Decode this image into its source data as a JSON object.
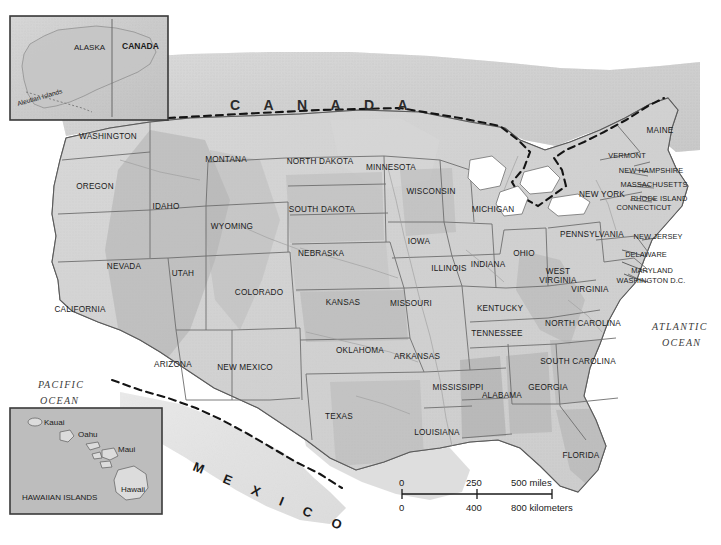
{
  "map": {
    "title": "Map of the United States",
    "country_label": "C A N A D A",
    "mexico_label": "M E X I C O",
    "oceans": [
      {
        "name": "pacific-ocean-label",
        "line1": "PACIFIC",
        "line2": "OCEAN"
      },
      {
        "name": "atlantic-ocean-label",
        "line1": "ATLANTIC",
        "line2": "OCEAN"
      }
    ],
    "colors": {
      "land_light": "#e9e9e9",
      "land_mid": "#c9c9c9",
      "land_dark": "#b0b0b0",
      "water": "#ffffff",
      "border": "#6e6e6e",
      "border_strong": "#4a4a4a",
      "text": "#1a1a1a",
      "inset_fill": "#bdbdbd",
      "inset_frame": "#3a3a3a",
      "dashed_border": "#1a1a1a"
    },
    "states": [
      {
        "code": "WA",
        "label": "WASHINGTON",
        "x": 108,
        "y": 139
      },
      {
        "code": "OR",
        "label": "OREGON",
        "x": 95,
        "y": 189
      },
      {
        "code": "CA",
        "label": "CALIFORNIA",
        "x": 80,
        "y": 312
      },
      {
        "code": "NV",
        "label": "NEVADA",
        "x": 124,
        "y": 269
      },
      {
        "code": "ID",
        "label": "IDAHO",
        "x": 166,
        "y": 209
      },
      {
        "code": "MT",
        "label": "MONTANA",
        "x": 226,
        "y": 162
      },
      {
        "code": "WY",
        "label": "WYOMING",
        "x": 232,
        "y": 229
      },
      {
        "code": "UT",
        "label": "UTAH",
        "x": 183,
        "y": 276
      },
      {
        "code": "AZ",
        "label": "ARIZONA",
        "x": 173,
        "y": 367
      },
      {
        "code": "CO",
        "label": "COLORADO",
        "x": 259,
        "y": 295
      },
      {
        "code": "NM",
        "label": "NEW MEXICO",
        "x": 245,
        "y": 370
      },
      {
        "code": "ND",
        "label": "NORTH DAKOTA",
        "x": 320,
        "y": 164
      },
      {
        "code": "SD",
        "label": "SOUTH DAKOTA",
        "x": 322,
        "y": 212
      },
      {
        "code": "NE",
        "label": "NEBRASKA",
        "x": 321,
        "y": 256
      },
      {
        "code": "KS",
        "label": "KANSAS",
        "x": 343,
        "y": 305
      },
      {
        "code": "OK",
        "label": "OKLAHOMA",
        "x": 360,
        "y": 353
      },
      {
        "code": "TX",
        "label": "TEXAS",
        "x": 339,
        "y": 419
      },
      {
        "code": "MN",
        "label": "MINNESOTA",
        "x": 391,
        "y": 170
      },
      {
        "code": "IA",
        "label": "IOWA",
        "x": 419,
        "y": 244
      },
      {
        "code": "MO",
        "label": "MISSOURI",
        "x": 411,
        "y": 306
      },
      {
        "code": "AR",
        "label": "ARKANSAS",
        "x": 417,
        "y": 359
      },
      {
        "code": "LA",
        "label": "LOUISIANA",
        "x": 437,
        "y": 435
      },
      {
        "code": "WI",
        "label": "WISCONSIN",
        "x": 431,
        "y": 194
      },
      {
        "code": "IL",
        "label": "ILLINOIS",
        "x": 449,
        "y": 271
      },
      {
        "code": "MS",
        "label": "MISSISSIPPI",
        "x": 458,
        "y": 390
      },
      {
        "code": "MI",
        "label": "MICHIGAN",
        "x": 493,
        "y": 212
      },
      {
        "code": "IN",
        "label": "INDIANA",
        "x": 488,
        "y": 267
      },
      {
        "code": "OH",
        "label": "OHIO",
        "x": 524,
        "y": 256
      },
      {
        "code": "KY",
        "label": "KENTUCKY",
        "x": 500,
        "y": 311
      },
      {
        "code": "TN",
        "label": "TENNESSEE",
        "x": 497,
        "y": 336
      },
      {
        "code": "AL",
        "label": "ALABAMA",
        "x": 502,
        "y": 398
      },
      {
        "code": "GA",
        "label": "GEORGIA",
        "x": 548,
        "y": 390
      },
      {
        "code": "FL",
        "label": "FLORIDA",
        "x": 581,
        "y": 458
      },
      {
        "code": "SC",
        "label": "SOUTH CAROLINA",
        "x": 578,
        "y": 364
      },
      {
        "code": "NC",
        "label": "NORTH CAROLINA",
        "x": 583,
        "y": 326
      },
      {
        "code": "VA",
        "label": "VIRGINIA",
        "x": 590,
        "y": 292
      },
      {
        "code": "WV",
        "label": "WEST",
        "x": 558,
        "y": 274
      },
      {
        "code": "WV2",
        "label": "VIRGINIA",
        "x": 558,
        "y": 283
      },
      {
        "code": "PA",
        "label": "PENNSYLVANIA",
        "x": 592,
        "y": 237
      },
      {
        "code": "NY",
        "label": "NEW YORK",
        "x": 602,
        "y": 197
      },
      {
        "code": "VT",
        "label": "VERMONT",
        "x": 627,
        "y": 158
      },
      {
        "code": "ME",
        "label": "MAINE",
        "x": 660,
        "y": 133
      },
      {
        "code": "NH",
        "label": "NEW HAMPSHIRE",
        "x": 651,
        "y": 173
      },
      {
        "code": "MA",
        "label": "MASSACHUSETTS",
        "x": 654,
        "y": 187
      },
      {
        "code": "RI",
        "label": "RHODE ISLAND",
        "x": 659,
        "y": 201
      },
      {
        "code": "CT",
        "label": "CONNECTICUT",
        "x": 644,
        "y": 210
      },
      {
        "code": "NJ",
        "label": "NEW JERSEY",
        "x": 658,
        "y": 239
      },
      {
        "code": "DE",
        "label": "DELAWARE",
        "x": 646,
        "y": 257
      },
      {
        "code": "MD",
        "label": "MARYLAND",
        "x": 652,
        "y": 273
      },
      {
        "code": "DC",
        "label": "WASHINGTON D.C.",
        "x": 651,
        "y": 283
      }
    ],
    "scale": {
      "miles": {
        "ticks": [
          "0",
          "250",
          "500 miles"
        ]
      },
      "kilometers": {
        "ticks": [
          "0",
          "400",
          "800 kilometers"
        ]
      }
    },
    "insets": {
      "alaska": {
        "name": "alaska-inset",
        "labels": [
          {
            "text": "ALASKA",
            "x": 88,
            "y": 48,
            "bold": false
          },
          {
            "text": "CANADA",
            "x": 130,
            "y": 47,
            "bold": true
          },
          {
            "text": "Aleutian Islands",
            "x": 22,
            "y": 100,
            "bold": false
          }
        ]
      },
      "hawaii": {
        "name": "hawaii-inset",
        "labels": [
          {
            "text": "Kauai",
            "x": 44,
            "y": 425,
            "bold": false
          },
          {
            "text": "Oahu",
            "x": 78,
            "y": 437,
            "bold": false
          },
          {
            "text": "Maui",
            "x": 118,
            "y": 452,
            "bold": false
          },
          {
            "text": "Hawaii",
            "x": 123,
            "y": 492,
            "bold": false
          },
          {
            "text": "HAWAIIAN ISLANDS",
            "x": 22,
            "y": 499,
            "bold": false
          }
        ]
      }
    }
  }
}
